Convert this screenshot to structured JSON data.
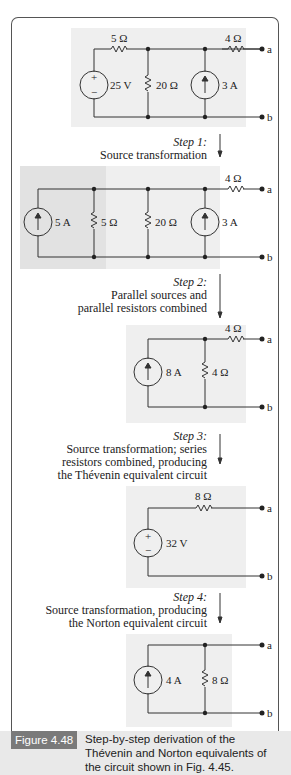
{
  "figure": {
    "label": "Figure 4.48",
    "caption": "Step-by-step derivation of the Thévenin and Norton equivalents of the circuit shown in Fig. 4.45."
  },
  "steps": [
    {
      "title": "Step 1:",
      "text": [
        "Source transformation"
      ]
    },
    {
      "title": "Step 2:",
      "text": [
        "Parallel sources and",
        "parallel resistors combined"
      ]
    },
    {
      "title": "Step 3:",
      "text": [
        "Source transformation; series",
        "resistors combined, producing",
        "the Thévenin equivalent circuit"
      ]
    },
    {
      "title": "Step 4:",
      "text": [
        "Source transformation, producing",
        "the Norton equivalent circuit"
      ]
    }
  ],
  "circuits": {
    "c1": {
      "r_series": "5 Ω",
      "r_out": "4 Ω",
      "v_source": "25 V",
      "r_shunt": "20 Ω",
      "i_source": "3 A",
      "term_a": "a",
      "term_b": "b",
      "plus": "+",
      "minus": "−"
    },
    "c2": {
      "i_source1": "5 A",
      "r1": "5 Ω",
      "r2": "20 Ω",
      "i_source2": "3 A",
      "r_out": "4 Ω",
      "term_a": "a",
      "term_b": "b"
    },
    "c3": {
      "i_source": "8 A",
      "r_shunt": "4 Ω",
      "r_out": "4 Ω",
      "term_a": "a",
      "term_b": "b"
    },
    "c4": {
      "v_source": "32 V",
      "r_series": "8 Ω",
      "term_a": "a",
      "term_b": "b",
      "plus": "+",
      "minus": "−"
    },
    "c5": {
      "i_source": "4 A",
      "r_shunt": "8 Ω",
      "term_a": "a",
      "term_b": "b"
    }
  },
  "colors": {
    "panel": "#efefef",
    "panel_dark": "#e2e2e2",
    "wire": "#333333",
    "caption_bg": "#e9e9e9",
    "caption_label_bg": "#7a7a7a"
  }
}
